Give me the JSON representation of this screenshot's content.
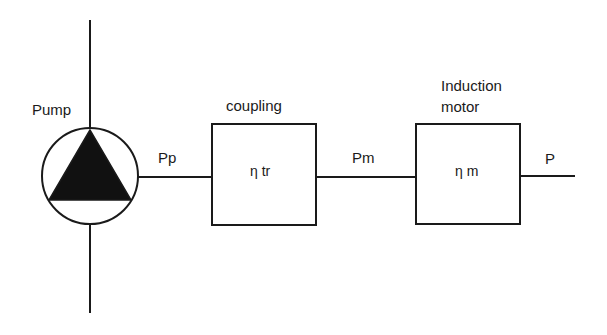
{
  "diagram": {
    "type": "power-flow block diagram",
    "pump": {
      "label": "Pump",
      "symbol": "pump-icon"
    },
    "blocks": [
      {
        "id": "coupling",
        "title": "coupling",
        "efficiency": "η tr"
      },
      {
        "id": "motor",
        "title_line1": "Induction",
        "title_line2": "motor",
        "efficiency": "η m"
      }
    ],
    "signals": [
      {
        "id": "pp",
        "label": "Pp"
      },
      {
        "id": "pm",
        "label": "Pm"
      },
      {
        "id": "p",
        "label": "P"
      }
    ],
    "colors": {
      "ink": "#1a1a1a",
      "background": "#ffffff"
    }
  }
}
